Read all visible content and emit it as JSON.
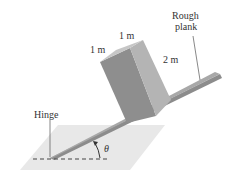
{
  "diagram": {
    "labels": {
      "rough_plank_line1": "Rough",
      "rough_plank_line2": "plank",
      "hinge": "Hinge",
      "angle": "θ",
      "dim_depth": "1 m",
      "dim_width": "1 m",
      "dim_height": "2 m"
    },
    "colors": {
      "ground": "#e6e6e6",
      "plank": "#9a9a9a",
      "box_front": "#8a8a8a",
      "box_side": "#b0b0b0",
      "box_top": "#c8c8c8",
      "text": "#333333"
    }
  }
}
